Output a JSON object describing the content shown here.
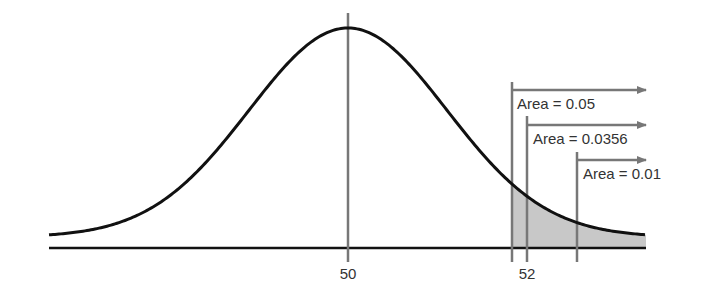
{
  "diagram": {
    "type": "normal-distribution-right-tail",
    "mean_label": "50",
    "value_label": "52",
    "areas": [
      {
        "label": "Area = 0.05",
        "value": 0.05
      },
      {
        "label": "Area = 0.0356",
        "value": 0.0356
      },
      {
        "label": "Area = 0.01",
        "value": 0.01
      }
    ],
    "colors": {
      "curve": "#111111",
      "axis": "#111111",
      "guide_lines": "#777777",
      "shading": "#c8c8c8",
      "text": "#333333"
    }
  },
  "chart_data": {
    "type": "area",
    "title": "",
    "xlabel": "",
    "ylabel": "",
    "x_tick_labels": [
      "50",
      "52"
    ],
    "annotations": [
      "Area = 0.05",
      "Area = 0.0356",
      "Area = 0.01"
    ],
    "distribution": "normal",
    "mean": 50,
    "shaded_region": "right tail",
    "tail_areas": [
      0.05,
      0.0356,
      0.01
    ]
  }
}
